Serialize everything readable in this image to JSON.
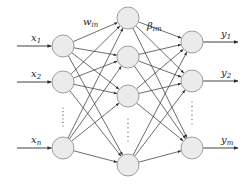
{
  "diagram": {
    "colors": {
      "node_fill": "#ebebeb",
      "node_stroke": "#9e9e9e",
      "edge": "#2e2e2e",
      "text": "#222222",
      "background": "#ffffff"
    },
    "node_radius": 11,
    "layers": {
      "input": {
        "x": 63,
        "nodes": [
          {
            "y": 46,
            "label": "x",
            "sub": "1"
          },
          {
            "y": 82,
            "label": "x",
            "sub": "2"
          },
          {
            "y": 148,
            "label": "x",
            "sub": "n"
          }
        ],
        "ellipsis_y": [
          108,
          126
        ]
      },
      "hidden": {
        "x": 128,
        "nodes": [
          {
            "y": 18
          },
          {
            "y": 57
          },
          {
            "y": 96
          },
          {
            "y": 165
          }
        ],
        "ellipsis_y": [
          119,
          141
        ]
      },
      "output": {
        "x": 192,
        "nodes": [
          {
            "y": 42,
            "label": "y",
            "sub": "1"
          },
          {
            "y": 81,
            "label": "y",
            "sub": "2"
          },
          {
            "y": 148,
            "label": "y",
            "sub": "m"
          }
        ],
        "ellipsis_y": [
          102,
          124
        ]
      }
    },
    "weights": {
      "input_hidden": {
        "label": "w",
        "sub": "in",
        "x": 83,
        "y": 25
      },
      "hidden_output": {
        "label": "β",
        "sub": "im",
        "x": 147,
        "y": 29
      }
    },
    "arrows": {
      "input_start_x": 17,
      "output_end_x": 238
    }
  }
}
